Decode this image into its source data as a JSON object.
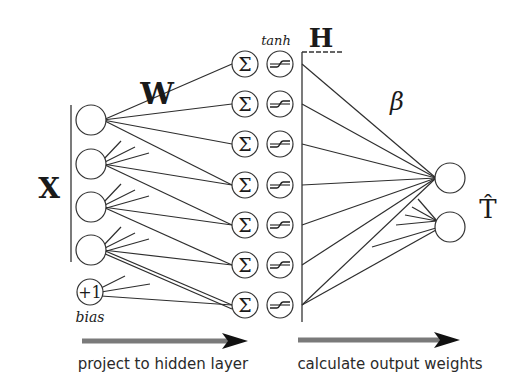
{
  "diagram": {
    "title_labels": {
      "weights_input": "W",
      "input_matrix": "X",
      "hidden_matrix": "H",
      "activation": "tanh",
      "weights_output": "β",
      "output": "T̂",
      "bias_node": "+1",
      "bias_label": "bias",
      "sum_symbol": "Σ"
    },
    "arrows": [
      {
        "label": "project to hidden layer"
      },
      {
        "label": "calculate output weights"
      }
    ],
    "layers": {
      "input": {
        "count": 4,
        "has_bias": true
      },
      "hidden": {
        "count": 7,
        "units": [
          "sum",
          "tanh"
        ]
      },
      "output": {
        "count": 2
      }
    },
    "colors": {
      "line": "#2e2e2e",
      "node_fill": "#ffffff",
      "arrow_shaft": "#7a7a7a",
      "arrow_head": "#111111",
      "text": "#1a1a1a"
    }
  }
}
